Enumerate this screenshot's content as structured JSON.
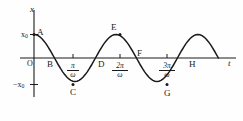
{
  "figure": {
    "axes": {
      "y_axis_label": "x",
      "x_axis_label": "t",
      "origin_label": "O"
    },
    "y_ticks": [
      {
        "label_html": "x0",
        "label": "x₀",
        "value": 1
      },
      {
        "label_html": "-x0",
        "label": "−x₀",
        "value": -1
      }
    ],
    "x_ticks": [
      {
        "numerator": "π",
        "denominator": "ω",
        "label": "π/ω"
      },
      {
        "numerator": "2π",
        "denominator": "ω",
        "label": "2π/ω"
      },
      {
        "numerator": "3π",
        "denominator": "ω",
        "label": "3π/ω"
      }
    ],
    "point_labels": [
      {
        "name": "A",
        "label": "A"
      },
      {
        "name": "B",
        "label": "B"
      },
      {
        "name": "C",
        "label": "C"
      },
      {
        "name": "D",
        "label": "D"
      },
      {
        "name": "E",
        "label": "E"
      },
      {
        "name": "F",
        "label": "F"
      },
      {
        "name": "G",
        "label": "G"
      },
      {
        "name": "H",
        "label": "H"
      }
    ],
    "stroke_color": "#1a1a1a",
    "background_color": "#fefefe"
  },
  "chart_data": {
    "type": "line",
    "title": "",
    "xlabel": "t",
    "ylabel": "x",
    "grid": false,
    "legend": null,
    "curve_equation": "x = x0 * cos(omega * t)",
    "amplitude": 1,
    "period_label": "2π/ω",
    "xlim": [
      0,
      4.6
    ],
    "ylim": [
      -1.25,
      1.25
    ],
    "x_tick_values": [
      1,
      2,
      3
    ],
    "x_tick_labels": [
      "π/ω",
      "2π/ω",
      "3π/ω"
    ],
    "y_tick_values": [
      1,
      -1
    ],
    "y_tick_labels": [
      "x₀",
      "−x₀"
    ],
    "marked_points": [
      {
        "label": "A",
        "t": 0.0,
        "x": 1.0,
        "t_label": "0",
        "x_label": "x₀"
      },
      {
        "label": "B",
        "t": 0.5,
        "x": 0.0,
        "t_label": "π/2ω",
        "x_label": "0"
      },
      {
        "label": "C",
        "t": 1.0,
        "x": -1.0,
        "t_label": "π/ω",
        "x_label": "−x₀"
      },
      {
        "label": "D",
        "t": 1.5,
        "x": 0.0,
        "t_label": "3π/2ω",
        "x_label": "0"
      },
      {
        "label": "E",
        "t": 2.0,
        "x": 1.0,
        "t_label": "2π/ω",
        "x_label": "x₀"
      },
      {
        "label": "F",
        "t": 2.5,
        "x": 0.0,
        "t_label": "5π/2ω",
        "x_label": "0"
      },
      {
        "label": "G",
        "t": 3.0,
        "x": -1.0,
        "t_label": "3π/ω",
        "x_label": "−x₀"
      },
      {
        "label": "H",
        "t": 3.5,
        "x": 0.0,
        "t_label": "7π/2ω",
        "x_label": "0"
      }
    ],
    "series": [
      {
        "name": "x(t)",
        "values": [
          1.0,
          0.988,
          0.951,
          0.891,
          0.809,
          0.707,
          0.588,
          0.454,
          0.309,
          0.156,
          0.0,
          -0.156,
          -0.309,
          -0.454,
          -0.588,
          -0.707,
          -0.809,
          -0.891,
          -0.951,
          -0.988,
          -1.0,
          -0.988,
          -0.951,
          -0.891,
          -0.809,
          -0.707,
          -0.588,
          -0.454,
          -0.309,
          -0.156,
          0.0,
          0.156,
          0.309,
          0.454,
          0.588,
          0.707,
          0.809,
          0.891,
          0.951,
          0.988,
          1.0,
          0.988,
          0.951,
          0.891,
          0.809,
          0.707,
          0.588,
          0.454,
          0.309,
          0.156,
          0.0,
          -0.156,
          -0.309,
          -0.454,
          -0.588,
          -0.707,
          -0.809,
          -0.891,
          -0.951,
          -0.988,
          -1.0,
          -0.988,
          -0.951,
          -0.891,
          -0.809,
          -0.707,
          -0.588,
          -0.454,
          -0.309,
          -0.156,
          0.0,
          0.156,
          0.309,
          0.454,
          0.588,
          0.707,
          0.809,
          0.891,
          0.951,
          0.988,
          1.0,
          0.988,
          0.951,
          0.891,
          0.809,
          0.707,
          0.588,
          0.454,
          0.309,
          0.156,
          0.0
        ],
        "x": [
          0.0,
          0.05,
          0.1,
          0.15,
          0.2,
          0.25,
          0.3,
          0.35,
          0.4,
          0.45,
          0.5,
          0.55,
          0.6,
          0.65,
          0.7,
          0.75,
          0.8,
          0.85,
          0.9,
          0.95,
          1.0,
          1.05,
          1.1,
          1.15,
          1.2,
          1.25,
          1.3,
          1.35,
          1.4,
          1.45,
          1.5,
          1.55,
          1.6,
          1.65,
          1.7,
          1.75,
          1.8,
          1.85,
          1.9,
          1.95,
          2.0,
          2.05,
          2.1,
          2.15,
          2.2,
          2.25,
          2.3,
          2.35,
          2.4,
          2.45,
          2.5,
          2.55,
          2.6,
          2.65,
          2.7,
          2.75,
          2.8,
          2.85,
          2.9,
          2.95,
          3.0,
          3.05,
          3.1,
          3.15,
          3.2,
          3.25,
          3.3,
          3.35,
          3.4,
          3.45,
          3.5,
          3.55,
          3.6,
          3.65,
          3.7,
          3.75,
          3.8,
          3.85,
          3.9,
          3.95,
          4.0,
          4.05,
          4.1,
          4.15,
          4.2,
          4.25,
          4.3,
          4.35,
          4.4,
          4.45,
          4.5
        ]
      }
    ]
  }
}
